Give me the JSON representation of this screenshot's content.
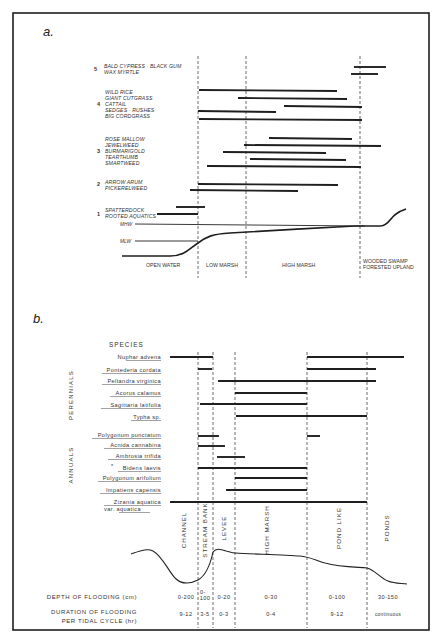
{
  "figure": {
    "panel_a": {
      "label": "a.",
      "groups": [
        {
          "number": "5",
          "species": [
            "BALD CYPRESS · BLACK GUM",
            "WAX MYRTLE"
          ]
        },
        {
          "number": "4",
          "species": [
            "WILD RICE",
            "GIANT CUTGRASS",
            "CATTAIL",
            "SEDGES · RUSHES",
            "BIG CORDGRASS"
          ]
        },
        {
          "number": "3",
          "species": [
            "ROSE MALLOW",
            "JEWELWEED",
            "BURMARIGOLD",
            "TEARTHUMB",
            "SMARTWEED"
          ]
        },
        {
          "number": "2",
          "species": [
            "ARROW ARUM",
            "PICKERELWEED"
          ]
        },
        {
          "number": "1",
          "species": [
            "SPATTERDOCK",
            "ROOTED AQUATICS"
          ]
        }
      ],
      "water_levels": {
        "mhw": "MHW",
        "mlw": "MLW"
      },
      "zones": [
        "OPEN WATER",
        "LOW MARSH",
        "HIGH MARSH",
        "WOODED SWAMP",
        "FORESTED UPLAND"
      ]
    },
    "panel_b": {
      "label": "b.",
      "species_header": "SPECIES",
      "categories": {
        "perennials": "PERENNIALS",
        "annuals": "ANNUALS"
      },
      "perennials": [
        "Nuphar advena",
        "Pontederia cordata",
        "Peltandra virginica",
        "Acorus calamus",
        "Sagittaria latifolia",
        "Typha sp."
      ],
      "annuals": [
        "Polygonum punctatum",
        "Acnida cannabina",
        "Ambrosia trifida",
        "Bidens laevis",
        "Polygonum arifolium",
        "Impatiens capensis",
        "Zizania aquatica",
        "var. aquatica"
      ],
      "annual_marker": "*",
      "zones": [
        "CHANNEL",
        "STREAM BANK",
        "LEVEE",
        "HIGH MARSH",
        "POND LIKE",
        "PONDS"
      ],
      "depth_label": "DEPTH OF FLOODING (cm)",
      "depth_values": [
        "0-200",
        "0-\n100",
        "0-20",
        "0-30",
        "0-100",
        "30-150"
      ],
      "depth_v1": "0-",
      "depth_v1b": "100",
      "duration_label_1": "DURATION OF FLOODING",
      "duration_label_2": "PER TIDAL CYCLE (hr)",
      "duration_values": [
        "9-12",
        "3-5",
        "0-3",
        "0-4",
        "9-12",
        "continuous"
      ]
    }
  }
}
